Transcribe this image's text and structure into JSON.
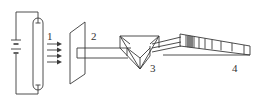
{
  "diagram": {
    "type": "optics-apparatus",
    "colors": {
      "line": "#3a3a3a",
      "text": "#333333",
      "background": "#ffffff"
    },
    "labels": {
      "source": "1",
      "slit": "2",
      "prism": "3",
      "screen": "4"
    },
    "components": [
      {
        "id": "source",
        "label": "1",
        "name": "discharge tube with battery circuit"
      },
      {
        "id": "slit",
        "label": "2",
        "name": "slit plate"
      },
      {
        "id": "prism",
        "label": "3",
        "name": "prism"
      },
      {
        "id": "screen",
        "label": "4",
        "name": "spectrum / screen"
      }
    ],
    "arrow_count": 4
  }
}
